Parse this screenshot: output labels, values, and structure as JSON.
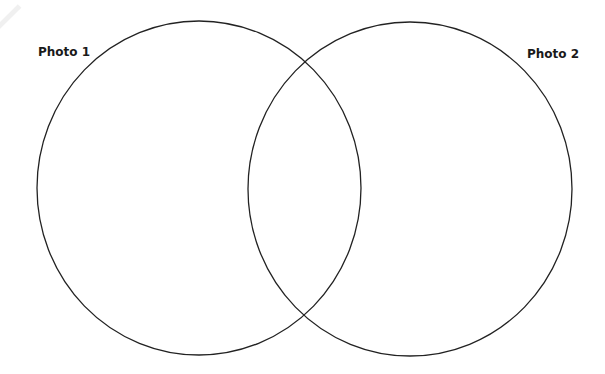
{
  "diagram": {
    "type": "venn",
    "sets": [
      {
        "id": "photo-1",
        "label": "Photo 1",
        "shape": "ellipse",
        "cx": 199,
        "cy": 188,
        "rx": 162,
        "ry": 167,
        "stroke": "#222222",
        "fill": "none"
      },
      {
        "id": "photo-2",
        "label": "Photo 2",
        "shape": "ellipse",
        "cx": 410,
        "cy": 189,
        "rx": 162,
        "ry": 167,
        "stroke": "#222222",
        "fill": "none"
      }
    ],
    "regions": {
      "photo_1_only": "",
      "overlap": "",
      "photo_2_only": ""
    },
    "background": "#ffffff"
  }
}
